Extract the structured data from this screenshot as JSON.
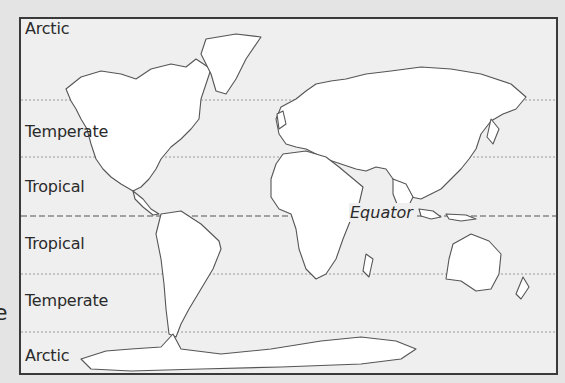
{
  "map": {
    "title": "World Climate Zones",
    "zones": [
      {
        "label": "Arctic",
        "position": "north"
      },
      {
        "label": "Temperate",
        "position": "north"
      },
      {
        "label": "Tropical",
        "position": "north"
      },
      {
        "label": "Tropical",
        "position": "south"
      },
      {
        "label": "Temperate",
        "position": "south"
      },
      {
        "label": "Arctic",
        "position": "south"
      }
    ],
    "equator_label": "Equator",
    "stray_text": "e"
  },
  "colors": {
    "background": "#e4e4e4",
    "map_fill": "#efefef",
    "land": "#ffffff",
    "outline": "#555555",
    "border": "#3a3a3a"
  }
}
